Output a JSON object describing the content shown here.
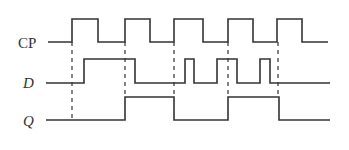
{
  "diagram": {
    "type": "timing-diagram",
    "line_color": "#333333",
    "background": "#ffffff",
    "signals": [
      {
        "name": "CP",
        "label": "CP",
        "italic": false,
        "label_pos": [
          18,
          36
        ],
        "points": [
          [
            48,
            42
          ],
          [
            72,
            42
          ],
          [
            72,
            19
          ],
          [
            98,
            19
          ],
          [
            98,
            42
          ],
          [
            125,
            42
          ],
          [
            125,
            19
          ],
          [
            150,
            19
          ],
          [
            150,
            42
          ],
          [
            174,
            42
          ],
          [
            174,
            19
          ],
          [
            203,
            19
          ],
          [
            203,
            42
          ],
          [
            228,
            42
          ],
          [
            228,
            19
          ],
          [
            253,
            19
          ],
          [
            253,
            42
          ],
          [
            277,
            42
          ],
          [
            277,
            19
          ],
          [
            302,
            19
          ],
          [
            302,
            42
          ],
          [
            328,
            42
          ]
        ]
      },
      {
        "name": "D",
        "label": "D",
        "italic": true,
        "label_pos": [
          23,
          76
        ],
        "points": [
          [
            46,
            83
          ],
          [
            84,
            83
          ],
          [
            84,
            59
          ],
          [
            135,
            59
          ],
          [
            135,
            83
          ],
          [
            185,
            83
          ],
          [
            185,
            59
          ],
          [
            194,
            59
          ],
          [
            194,
            83
          ],
          [
            217,
            83
          ],
          [
            217,
            59
          ],
          [
            237,
            59
          ],
          [
            237,
            83
          ],
          [
            260,
            83
          ],
          [
            260,
            59
          ],
          [
            270,
            59
          ],
          [
            270,
            83
          ],
          [
            330,
            83
          ]
        ]
      },
      {
        "name": "Q",
        "label": "Q",
        "italic": true,
        "label_pos": [
          23,
          114
        ],
        "points": [
          [
            46,
            120
          ],
          [
            125,
            120
          ],
          [
            125,
            97
          ],
          [
            174,
            97
          ],
          [
            174,
            120
          ],
          [
            228,
            120
          ],
          [
            228,
            97
          ],
          [
            279,
            97
          ],
          [
            279,
            120
          ],
          [
            330,
            120
          ]
        ]
      }
    ],
    "dashed_guides": [
      {
        "x": 72,
        "y1": 42,
        "y2": 120
      },
      {
        "x": 125,
        "y1": 42,
        "y2": 97
      },
      {
        "x": 174,
        "y1": 42,
        "y2": 97
      },
      {
        "x": 228,
        "y1": 42,
        "y2": 97
      },
      {
        "x": 278,
        "y1": 42,
        "y2": 97
      }
    ]
  }
}
